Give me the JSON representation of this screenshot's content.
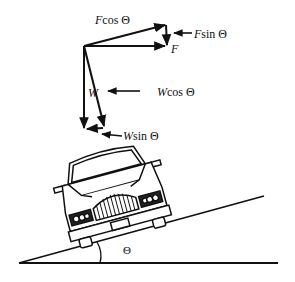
{
  "diagram": {
    "type": "force-diagram",
    "labels": {
      "f_cos": {
        "var": "F",
        "text": "cos  Θ"
      },
      "f_sin": {
        "var": "F",
        "text": "sin  Θ"
      },
      "f": {
        "var": "F",
        "text": ""
      },
      "w": {
        "var": "W",
        "text": ""
      },
      "w_cos": {
        "var": "W",
        "text": "cos Θ"
      },
      "w_sin": {
        "var": "W",
        "text": "sin Θ"
      },
      "angle": {
        "text": "Θ"
      }
    },
    "colors": {
      "stroke": "#111111",
      "background": "#ffffff"
    }
  }
}
